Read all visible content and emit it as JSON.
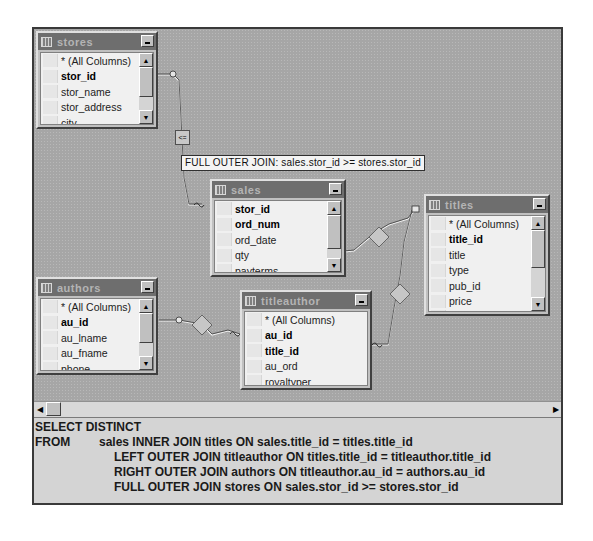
{
  "diagram": {
    "tables": [
      {
        "id": "stores",
        "title": "stores",
        "columns": [
          {
            "name": "* (All Columns)",
            "key": false
          },
          {
            "name": "stor_id",
            "key": true
          },
          {
            "name": "stor_name",
            "key": false
          },
          {
            "name": "stor_address",
            "key": false
          },
          {
            "name": "city",
            "key": false
          }
        ]
      },
      {
        "id": "sales",
        "title": "sales",
        "columns": [
          {
            "name": "stor_id",
            "key": true
          },
          {
            "name": "ord_num",
            "key": true
          },
          {
            "name": "ord_date",
            "key": false
          },
          {
            "name": "qty",
            "key": false
          },
          {
            "name": "payterms",
            "key": false
          }
        ]
      },
      {
        "id": "titles",
        "title": "titles",
        "columns": [
          {
            "name": "* (All Columns)",
            "key": false
          },
          {
            "name": "title_id",
            "key": true
          },
          {
            "name": "title",
            "key": false
          },
          {
            "name": "type",
            "key": false
          },
          {
            "name": "pub_id",
            "key": false
          },
          {
            "name": "price",
            "key": false
          },
          {
            "name": "advance",
            "key": false
          }
        ]
      },
      {
        "id": "authors",
        "title": "authors",
        "columns": [
          {
            "name": "* (All Columns)",
            "key": false
          },
          {
            "name": "au_id",
            "key": true
          },
          {
            "name": "au_lname",
            "key": false
          },
          {
            "name": "au_fname",
            "key": false
          },
          {
            "name": "phone",
            "key": false
          }
        ]
      },
      {
        "id": "titleauthor",
        "title": "titleauthor",
        "columns": [
          {
            "name": "* (All Columns)",
            "key": false
          },
          {
            "name": "au_id",
            "key": true
          },
          {
            "name": "title_id",
            "key": true
          },
          {
            "name": "au_ord",
            "key": false
          },
          {
            "name": "royaltyper",
            "key": false
          }
        ]
      }
    ],
    "join_tooltip": "FULL OUTER JOIN: sales.stor_id >= stores.stor_id",
    "join_symbol": "<=",
    "icons": {
      "table": "table-grid-icon",
      "minimize": "minimize-icon",
      "scroll_up": "▲",
      "scroll_down": "▼",
      "scroll_left": "◀",
      "scroll_right": "▶"
    }
  },
  "sql": {
    "select_keyword": "SELECT DISTINCT",
    "from_keyword": "FROM",
    "from_line": "sales INNER JOIN titles ON sales.title_id = titles.title_id",
    "join_lines": [
      "LEFT OUTER JOIN titleauthor ON titles.title_id = titleauthor.title_id",
      "RIGHT OUTER JOIN authors ON titleauthor.au_id = authors.au_id",
      "FULL OUTER JOIN stores ON sales.stor_id >= stores.stor_id"
    ]
  }
}
